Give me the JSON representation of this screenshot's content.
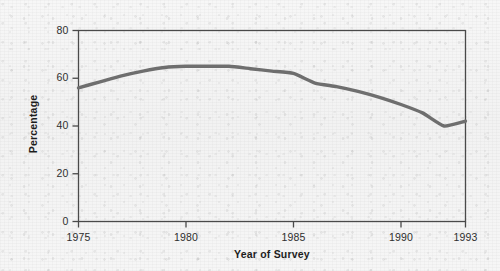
{
  "chart_data": {
    "type": "line",
    "title": "",
    "xlabel": "Year of Survey",
    "ylabel": "Percentage",
    "xlim": [
      1975,
      1993
    ],
    "ylim": [
      0,
      80
    ],
    "grid": false,
    "legend": null,
    "xticks": [
      "1975",
      "1980",
      "1985",
      "1990",
      "1993"
    ],
    "xtick_values": [
      1975,
      1980,
      1985,
      1990,
      1993
    ],
    "yticks": [
      "0",
      "20",
      "40",
      "60",
      "80"
    ],
    "ytick_values": [
      0,
      20,
      40,
      60,
      80
    ],
    "series": [
      {
        "name": "Percentage",
        "color": "#6e6e6e",
        "x": [
          1975,
          1976,
          1977,
          1978,
          1979,
          1980,
          1981,
          1982,
          1983,
          1984,
          1985,
          1986,
          1987,
          1988,
          1989,
          1990,
          1991,
          1992,
          1993
        ],
        "values": [
          56,
          58.5,
          61,
          63,
          64.5,
          65,
          65,
          65,
          64,
          63,
          62,
          58,
          56.5,
          54.5,
          52,
          49,
          45.5,
          40,
          42
        ]
      }
    ]
  },
  "figure": {
    "line_color": "#6e6e6e",
    "axis_color": "#4a4a4a",
    "background_color": "#f3f3f3",
    "text_color": "#2e2e2e"
  }
}
